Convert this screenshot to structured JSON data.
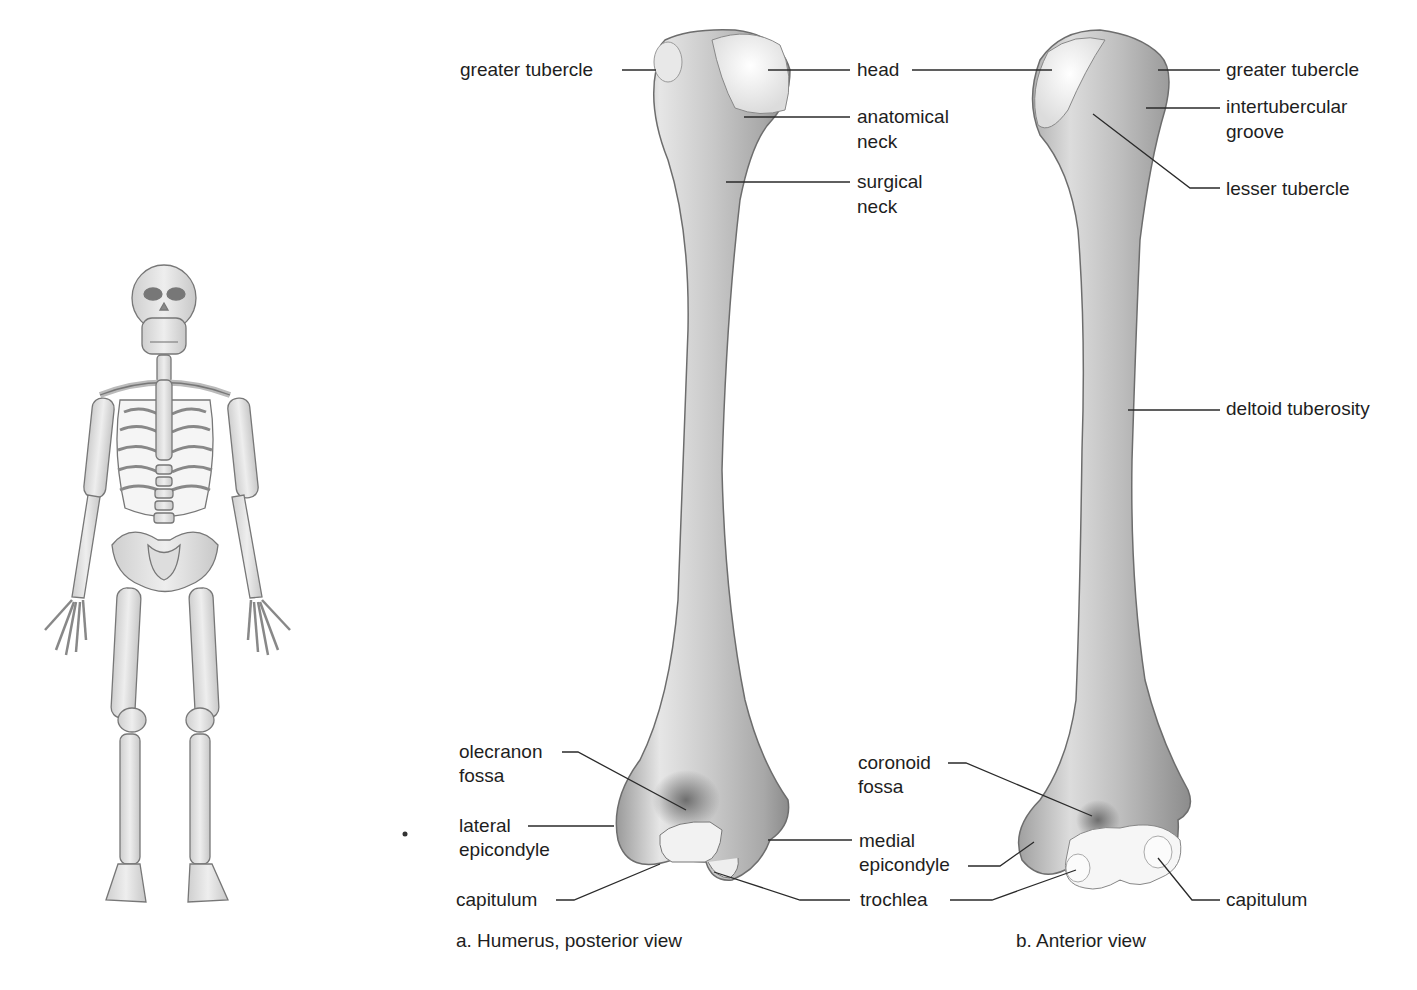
{
  "figure": {
    "panel_a": {
      "caption": "a. Humerus, posterior view",
      "labels": {
        "greater_tubercle": "greater tubercle",
        "head": "head",
        "anatomical_neck_1": "anatomical",
        "anatomical_neck_2": "neck",
        "surgical_neck_1": "surgical",
        "surgical_neck_2": "neck",
        "olecranon_fossa_1": "olecranon",
        "olecranon_fossa_2": "fossa",
        "lateral_epicondyle_1": "lateral",
        "lateral_epicondyle_2": "epicondyle",
        "capitulum": "capitulum",
        "medial_epicondyle_1": "medial",
        "medial_epicondyle_2": "epicondyle",
        "trochlea": "trochlea"
      }
    },
    "panel_b": {
      "caption": "b. Anterior view",
      "labels": {
        "greater_tubercle": "greater tubercle",
        "intertubercular_groove_1": "intertubercular",
        "intertubercular_groove_2": "groove",
        "lesser_tubercle": "lesser tubercle",
        "deltoid_tuberosity": "deltoid tuberosity",
        "coronoid_fossa_1": "coronoid",
        "coronoid_fossa_2": "fossa",
        "capitulum": "capitulum"
      }
    },
    "colors": {
      "bone_light": "#ececec",
      "bone_mid": "#c4c4c4",
      "bone_dark": "#8a8a8a",
      "leader": "#2a2a2a",
      "text": "#1e1e1e"
    }
  }
}
